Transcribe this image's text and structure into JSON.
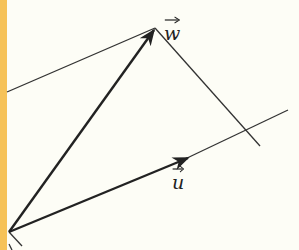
{
  "diagram": {
    "type": "vector-decomposition",
    "background": "#fdfdf6",
    "strip_color": "#f6c258",
    "line_color": "#333333",
    "origin": [
      9,
      232
    ],
    "vectors": [
      {
        "name": "w",
        "label": "w",
        "from": [
          9,
          232
        ],
        "to": [
          155,
          28
        ]
      },
      {
        "name": "u",
        "label": "u",
        "from": [
          9,
          232
        ],
        "to": [
          190,
          157
        ]
      }
    ],
    "lines": [
      {
        "name": "line-through-w-parallel-u",
        "from": [
          7,
          92
        ],
        "to": [
          155,
          28
        ]
      },
      {
        "name": "line-w-to-u-axis",
        "from": [
          155,
          28
        ],
        "to": [
          260,
          146
        ]
      },
      {
        "name": "u-axis-extension",
        "from": [
          190,
          157
        ],
        "to": [
          288,
          110
        ]
      },
      {
        "name": "lower-line",
        "from": [
          9,
          232
        ],
        "to": [
          22,
          246
        ]
      }
    ],
    "labels": {
      "w": "w",
      "u": "u"
    }
  }
}
